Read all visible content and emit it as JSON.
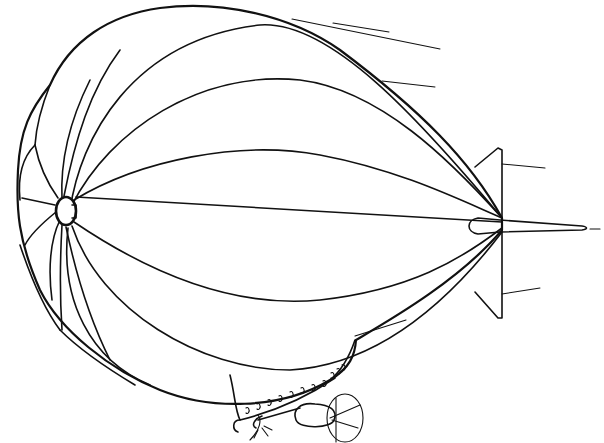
{
  "illustration": {
    "subject": "Airship (blimp) line drawing",
    "style": "black ink line art on white",
    "colors": {
      "ink": "#111111",
      "background": "#ffffff"
    },
    "parts": [
      "envelope",
      "nose-cap",
      "gores",
      "tail-fins",
      "tail-cone",
      "gondola",
      "gondola-windows",
      "engine-pods",
      "propellers",
      "speed-lines"
    ]
  }
}
